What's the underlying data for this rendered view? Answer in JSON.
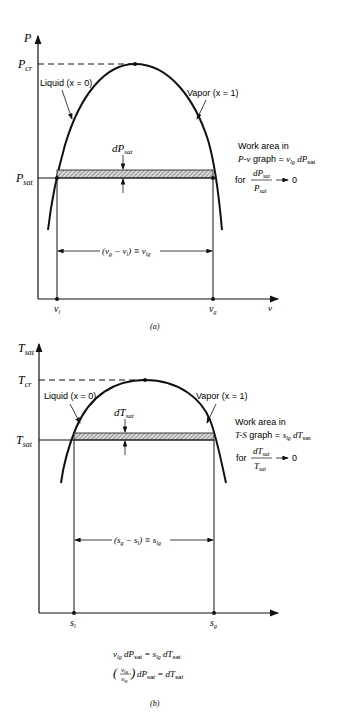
{
  "top": {
    "y_axis": "P",
    "x_axis": "v",
    "p_cr": "P",
    "p_cr_sub": "cr",
    "p_sat": "P",
    "p_sat_sub": "sat",
    "liquid": "Liquid (x = 0)",
    "vapor": "Vapor (x = 1)",
    "dp": "dP",
    "dp_sub": "sat",
    "work_line1": "Work area in",
    "work_line2": "P-v graph = v",
    "work_line2_sub": "lg",
    "work_line2_tail": "dP",
    "work_line2_tail_sub": "sat",
    "for": "for",
    "frac_num": "dP",
    "frac_den": "P",
    "frac_sub": "sat",
    "limit": "0",
    "span": "(v",
    "span_text": "(v_g − v_l) ≡ v_lg",
    "v_l": "v",
    "v_l_sub": "l",
    "v_g": "v",
    "v_g_sub": "g",
    "caption": "(a)"
  },
  "bottom": {
    "y_axis": "T",
    "y_axis_sub": "sat",
    "t_cr": "T",
    "t_cr_sub": "cr",
    "t_sat": "T",
    "t_sat_sub": "sat",
    "liquid": "Liquid (x = 0)",
    "vapor": "Vapor (x = 1)",
    "dt": "dT",
    "dt_sub": "sat",
    "work_line1": "Work area in",
    "work_line2": "T-S graph = s",
    "work_line2_sub": "lg",
    "work_line2_tail": "dT",
    "work_line2_tail_sub": "sat",
    "for": "for",
    "frac_num": "dT",
    "frac_den": "T",
    "frac_sub": "sat",
    "limit": "0",
    "span_text": "(s_g − s_l) ≡ s_lg",
    "s_l": "s",
    "s_l_sub": "l",
    "s_g": "s",
    "s_g_sub": "g",
    "eq1": "v_lg dP_sat = s_lg dT_sat",
    "eq2": "(v_lg / s_lg) dP_sat = dT_sat",
    "caption": "(b)"
  }
}
